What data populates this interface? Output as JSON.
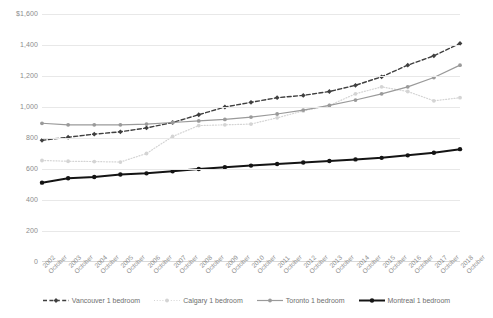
{
  "chart_data": {
    "type": "line",
    "title": "",
    "xlabel": "",
    "ylabel": "",
    "ylim": [
      0,
      1600
    ],
    "ytick_step": 200,
    "grid": true,
    "legend_position": "bottom",
    "x_month_label": "October",
    "categories": [
      "2002",
      "2003",
      "2004",
      "2005",
      "2006",
      "2007",
      "2008",
      "2009",
      "2010",
      "2011",
      "2012",
      "2013",
      "2014",
      "2015",
      "2016",
      "2017",
      "2018"
    ],
    "ytick_labels": [
      "$1,600",
      "1,400",
      "1,200",
      "1,000",
      "800",
      "600",
      "400",
      "200",
      "0"
    ],
    "ytick_values": [
      1600,
      1400,
      1200,
      1000,
      800,
      600,
      400,
      200,
      0
    ],
    "series": [
      {
        "name": "Vancouver 1 bedroom",
        "color": "#3f3f3f",
        "style": "dashed",
        "marker": "diamond",
        "values": [
          785,
          805,
          825,
          840,
          865,
          900,
          950,
          1000,
          1030,
          1060,
          1075,
          1100,
          1140,
          1195,
          1270,
          1330,
          1410
        ]
      },
      {
        "name": "Calgary 1 bedroom",
        "color": "#d4d4d4",
        "style": "dotted",
        "marker": "circle",
        "values": [
          655,
          650,
          648,
          645,
          700,
          810,
          880,
          885,
          890,
          930,
          975,
          1010,
          1085,
          1130,
          1100,
          1040,
          1060
        ]
      },
      {
        "name": "Toronto 1 bedroom",
        "color": "#9a9a9a",
        "style": "solid",
        "marker": "circle",
        "values": [
          895,
          885,
          885,
          885,
          890,
          900,
          910,
          920,
          935,
          955,
          980,
          1010,
          1045,
          1085,
          1130,
          1190,
          1270
        ]
      },
      {
        "name": "Montreal 1 bedroom",
        "color": "#141414",
        "style": "solid-bold",
        "marker": "circle",
        "values": [
          512,
          540,
          548,
          565,
          572,
          585,
          600,
          612,
          622,
          632,
          642,
          652,
          662,
          672,
          688,
          705,
          728
        ]
      }
    ]
  }
}
